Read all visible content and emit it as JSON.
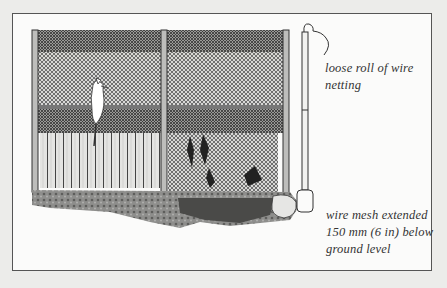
{
  "figure": {
    "captions": {
      "top_right": "loose roll of wire netting",
      "bottom_right": "wire mesh extended 150 mm (6 in) below ground level"
    },
    "colors": {
      "background": "#ececea",
      "paper": "#fbfbfa",
      "ink": "#333333",
      "mesh": "#6a6a6a"
    }
  }
}
